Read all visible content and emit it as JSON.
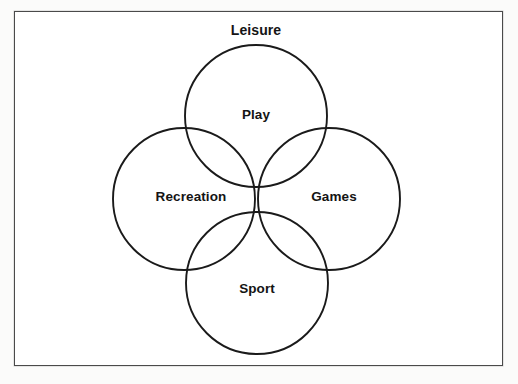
{
  "figure": {
    "type": "venn-diagram",
    "title": "Leisure",
    "frame": {
      "x": 14,
      "y": 11,
      "width": 489,
      "height": 355,
      "border_color": "#4a4a4a",
      "background_color": "#ffffff"
    },
    "stroke_color": "#1a1a1a",
    "label_color": "#141414",
    "sets": [
      {
        "id": "play",
        "label": "Play",
        "position": "top",
        "cx": 256,
        "cy": 116,
        "r": 71,
        "label_x": 256,
        "label_y": 114
      },
      {
        "id": "recreation",
        "label": "Recreation",
        "position": "left",
        "cx": 184,
        "cy": 199,
        "r": 71,
        "label_x": 191,
        "label_y": 196
      },
      {
        "id": "games",
        "label": "Games",
        "position": "right",
        "cx": 329,
        "cy": 199,
        "r": 71,
        "label_x": 334,
        "label_y": 196
      },
      {
        "id": "sport",
        "label": "Sport",
        "position": "bottom",
        "cx": 257,
        "cy": 283,
        "r": 71,
        "label_x": 257,
        "label_y": 288
      }
    ],
    "title_position": {
      "x": 256,
      "y": 30
    }
  },
  "chart_data": {
    "type": "venn",
    "title": "Leisure",
    "set_labels": [
      "Play",
      "Recreation",
      "Games",
      "Sport"
    ],
    "set_count": 4,
    "arrangement": "four-circle rosette (top, left, right, bottom) overlapping at a common centre",
    "annotations": [
      "Leisure"
    ],
    "xlabel": "",
    "ylabel": "",
    "legend": "none",
    "grid": false
  }
}
